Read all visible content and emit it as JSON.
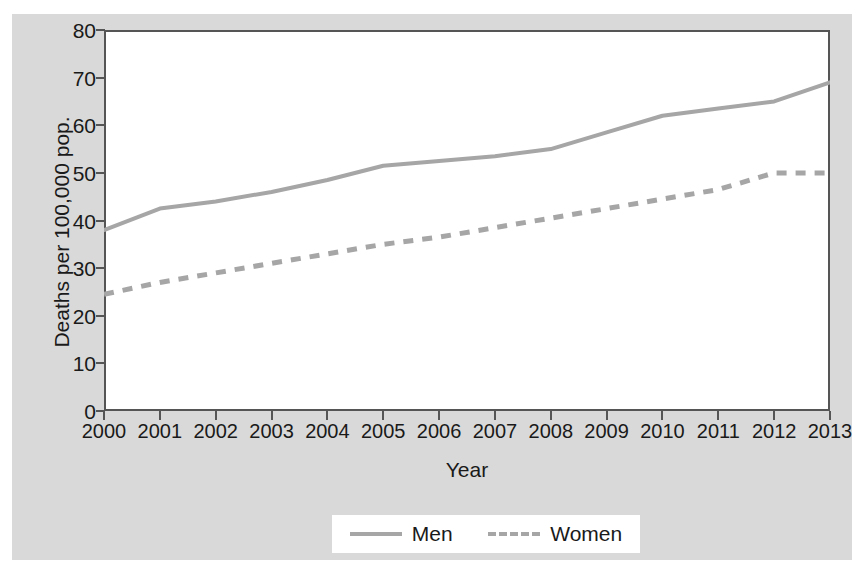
{
  "chart_data": {
    "type": "line",
    "title": "",
    "subtitle": "",
    "xlabel": "Year",
    "ylabel": "Deaths per 100,000 pop.",
    "x": [
      2000,
      2001,
      2002,
      2003,
      2004,
      2005,
      2006,
      2007,
      2008,
      2009,
      2010,
      2011,
      2012,
      2013
    ],
    "categories": [
      "2000",
      "2001",
      "2002",
      "2003",
      "2004",
      "2005",
      "2006",
      "2007",
      "2008",
      "2009",
      "2010",
      "2011",
      "2012",
      "2013"
    ],
    "xlim": [
      2000,
      2013
    ],
    "ylim": [
      0,
      80
    ],
    "yticks": [
      0,
      10,
      20,
      30,
      40,
      50,
      60,
      70,
      80
    ],
    "ytick_labels": [
      "0",
      "10",
      "20",
      "30",
      "40",
      "50",
      "60",
      "70",
      "80"
    ],
    "grid": false,
    "legend_position": "bottom-center",
    "series": [
      {
        "name": "Men",
        "style": "solid",
        "color": "#a6a6a6",
        "values": [
          38.0,
          42.5,
          44.0,
          46.0,
          48.5,
          51.5,
          52.5,
          53.5,
          55.0,
          58.5,
          62.0,
          63.5,
          65.0,
          69.0
        ]
      },
      {
        "name": "Women",
        "style": "dashed",
        "color": "#a6a6a6",
        "values": [
          24.5,
          27.0,
          29.0,
          31.0,
          33.0,
          35.0,
          36.5,
          38.5,
          40.5,
          42.5,
          44.5,
          46.5,
          50.0,
          50.0
        ]
      }
    ]
  },
  "legend": {
    "entries": [
      {
        "label": "Men"
      },
      {
        "label": "Women"
      }
    ]
  },
  "colors": {
    "figure_background": "#d9d9d9",
    "plot_background": "#ffffff",
    "axis": "#555555",
    "text": "#1a1a1a",
    "series_line": "#a6a6a6"
  }
}
